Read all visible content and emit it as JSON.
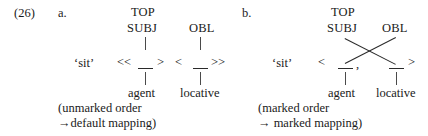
{
  "example": {
    "number": "(26)"
  },
  "items": [
    {
      "letter": "a.",
      "top_label": "TOP",
      "gf_left": "SUBJ",
      "gf_right": "OBL",
      "predicate": "‘sit’",
      "bracket_open": "<<",
      "bracket_mid_close": ">",
      "bracket_mid_open": "<",
      "bracket_close": ">>",
      "separator": "",
      "role_left": "agent",
      "role_right": "locative",
      "note_line1": "(unmarked order",
      "note_line2": "→default mapping)",
      "crossed": "false"
    },
    {
      "letter": "b.",
      "top_label": "TOP",
      "gf_left": "SUBJ",
      "gf_right": "OBL",
      "predicate": "‘sit’",
      "bracket_open": "<",
      "bracket_mid_close": "",
      "bracket_mid_open": "",
      "bracket_close": ">",
      "separator": ",",
      "role_left": "agent",
      "role_right": "locative",
      "note_line1": "(marked order",
      "note_line2": "→ marked mapping)",
      "crossed": "true"
    }
  ],
  "colors": {
    "background": "#ffffff",
    "text": "#1a1a1a",
    "line": "#2a2a2a",
    "connector": "#4a4a4a"
  }
}
